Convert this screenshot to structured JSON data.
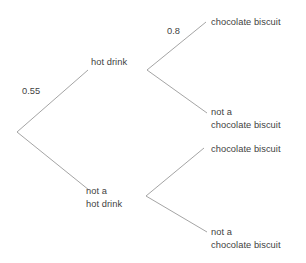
{
  "diagram": {
    "type": "probability-tree",
    "title": "",
    "colors": {
      "line": "#9a9a9a",
      "text": "#3f3f3f",
      "background": "#ffffff"
    },
    "root": {
      "label": ""
    },
    "level1": [
      {
        "label": "hot drink",
        "probability": "0.55"
      },
      {
        "label_line1": "not a",
        "label_line2": "hot drink",
        "probability": ""
      }
    ],
    "level2": [
      {
        "label": "chocolate biscuit",
        "probability": "0.8"
      },
      {
        "label_line1": "not a",
        "label_line2": "chocolate biscuit",
        "probability": ""
      },
      {
        "label": "chocolate biscuit",
        "probability": ""
      },
      {
        "label_line1": "not a",
        "label_line2": "chocolate biscuit",
        "probability": ""
      }
    ],
    "labels": {
      "hot_drink": "hot drink",
      "not_a": "not a",
      "not_a_hot_drink": "not a\nhot drink",
      "chocolate_biscuit": "chocolate biscuit",
      "not_a_chocolate_biscuit": "not a\nchocolate biscuit",
      "prob_root_upper": "0.55",
      "prob_branch_upper": "0.8"
    }
  }
}
